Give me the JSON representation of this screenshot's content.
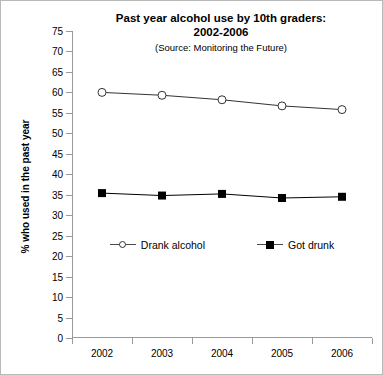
{
  "chart_data": {
    "type": "line",
    "title": "Past year alcohol use by 10th graders:\n2002-2006",
    "subtitle": "(Source: Monitoring the Future)",
    "xlabel": "",
    "ylabel": "% who used in the past year",
    "categories": [
      "2002",
      "2003",
      "2004",
      "2005",
      "2006"
    ],
    "x": [
      2002,
      2003,
      2004,
      2005,
      2006
    ],
    "ylim": [
      0,
      75
    ],
    "yticks": [
      0,
      5,
      10,
      15,
      20,
      25,
      30,
      35,
      40,
      45,
      50,
      55,
      60,
      65,
      70,
      75
    ],
    "ytick_labels": [
      "0",
      "5",
      "10",
      "15",
      "20",
      "25",
      "30",
      "35",
      "40",
      "45",
      "50",
      "55",
      "60",
      "65",
      "70",
      "75"
    ],
    "grid": false,
    "legend_position": "inside-lower-center",
    "series": [
      {
        "name": "Drank alcohol",
        "marker": "open-circle",
        "color": "#333333",
        "values": [
          60.0,
          59.3,
          58.2,
          56.7,
          55.8
        ]
      },
      {
        "name": "Got drunk",
        "marker": "filled-square",
        "color": "#000000",
        "values": [
          35.4,
          34.8,
          35.2,
          34.2,
          34.5
        ]
      }
    ]
  },
  "legend": {
    "items": [
      {
        "label": "Drank alcohol",
        "marker": "open-circle"
      },
      {
        "label": "Got drunk",
        "marker": "filled-square"
      }
    ]
  }
}
